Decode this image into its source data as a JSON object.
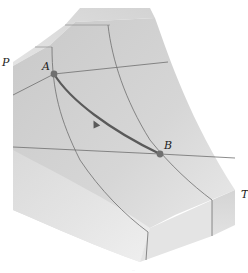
{
  "figure": {
    "type": "P-v-T surface",
    "axes": {
      "pressure_label": "P",
      "temperature_label": "T"
    },
    "points": [
      {
        "id": "A",
        "label": "A"
      },
      {
        "id": "B",
        "label": "B"
      }
    ],
    "process": {
      "from": "A",
      "to": "B",
      "direction_arrow": true
    },
    "caption_mark": "..."
  },
  "colors": {
    "surface_main": "#cfcfcf",
    "surface_top": "#dedede",
    "surface_light": "#e6e6e6",
    "surface_side": "#d6d6d6",
    "grid_line": "#6e6e6e",
    "path": "#5a5a5a",
    "point": "#707070"
  }
}
